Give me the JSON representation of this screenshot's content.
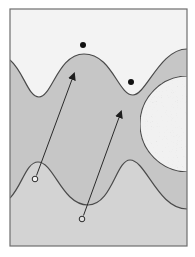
{
  "diagram": {
    "colors": {
      "background": "#ffffff",
      "frame": "#6e6e6e",
      "upper_region": "#f3f3f3",
      "middle_band": "#c6c6c6",
      "lower_region": "#d3d3d3",
      "circle_fill": "#f1f1f1",
      "stroke": "#4a4a4a",
      "dot": "#111111"
    },
    "frame": {
      "x": 10,
      "y": 9,
      "width": 177,
      "height": 237
    },
    "upper_boundary": {
      "points": [
        [
          10,
          60
        ],
        [
          39,
          97
        ],
        [
          84,
          54
        ],
        [
          133,
          95
        ],
        [
          187,
          49
        ]
      ]
    },
    "lower_boundary": {
      "points": [
        [
          10,
          198
        ],
        [
          38,
          162
        ],
        [
          88,
          205
        ],
        [
          130,
          160
        ],
        [
          187,
          209
        ]
      ]
    },
    "large_circle": {
      "cx": 188,
      "cy": 124,
      "r": 48
    },
    "dots": [
      {
        "cx": 83,
        "cy": 45,
        "r": 3
      },
      {
        "cx": 131,
        "cy": 82,
        "r": 3
      }
    ],
    "arrows": [
      {
        "tail": [
          35,
          179
        ],
        "head": [
          74,
          74
        ]
      },
      {
        "tail": [
          82,
          219
        ],
        "head": [
          121,
          112
        ]
      }
    ]
  }
}
